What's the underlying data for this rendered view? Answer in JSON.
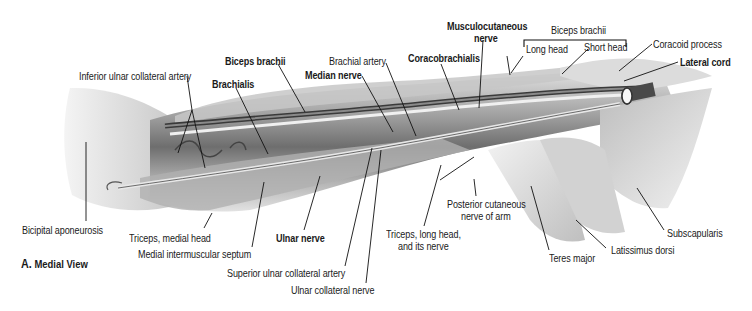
{
  "figure": {
    "caption_letter": "A.",
    "caption_text": "Medial View",
    "palette": {
      "background": "#ffffff",
      "muscle_light": "#d9d9d9",
      "muscle_mid": "#a6a6a6",
      "muscle_dark": "#5a5a5a",
      "vessel": "#3a3a3a",
      "leader_line": "#111111",
      "text": "#1a1a1a"
    },
    "bracket_label": "Biceps brachii",
    "labels": [
      {
        "id": "musculocutaneous-nerve-1",
        "text": "Musculocutaneous",
        "bold": true,
        "x": 447,
        "y": 20
      },
      {
        "id": "musculocutaneous-nerve-2",
        "text": "nerve",
        "bold": true,
        "x": 474,
        "y": 32
      },
      {
        "id": "biceps-brachii-top",
        "text": "Biceps brachii",
        "bold": false,
        "x": 551,
        "y": 24
      },
      {
        "id": "long-head",
        "text": "Long head",
        "bold": false,
        "x": 526,
        "y": 43
      },
      {
        "id": "short-head",
        "text": "Short head",
        "bold": false,
        "x": 584,
        "y": 41
      },
      {
        "id": "coracoid-process",
        "text": "Coracoid process",
        "bold": false,
        "x": 653,
        "y": 38
      },
      {
        "id": "lateral-cord",
        "text": "Lateral cord",
        "bold": true,
        "x": 680,
        "y": 56
      },
      {
        "id": "biceps-brachii",
        "text": "Biceps brachii",
        "bold": true,
        "x": 225,
        "y": 55
      },
      {
        "id": "brachial-artery",
        "text": "Brachial artery",
        "bold": false,
        "x": 329,
        "y": 55
      },
      {
        "id": "coracobrachialis",
        "text": "Coracobrachialis",
        "bold": true,
        "x": 408,
        "y": 52
      },
      {
        "id": "median-nerve",
        "text": "Median nerve",
        "bold": true,
        "x": 305,
        "y": 69
      },
      {
        "id": "inferior-ulnar-collateral-artery",
        "text": "Inferior ulnar collateral artery",
        "bold": false,
        "x": 79,
        "y": 70
      },
      {
        "id": "brachialis",
        "text": "Brachialis",
        "bold": true,
        "x": 212,
        "y": 78
      },
      {
        "id": "bicipital-aponeurosis",
        "text": "Bicipital aponeurosis",
        "bold": false,
        "x": 22,
        "y": 224
      },
      {
        "id": "triceps-medial-head",
        "text": "Triceps, medial head",
        "bold": false,
        "x": 129,
        "y": 232
      },
      {
        "id": "ulnar-nerve",
        "text": "Ulnar nerve",
        "bold": true,
        "x": 276,
        "y": 232
      },
      {
        "id": "medial-intermuscular-septum",
        "text": "Medial intermuscular septum",
        "bold": false,
        "x": 138,
        "y": 248
      },
      {
        "id": "superior-ulnar-collateral-artery",
        "text": "Superior ulnar collateral artery",
        "bold": false,
        "x": 227,
        "y": 267
      },
      {
        "id": "ulnar-collateral-nerve",
        "text": "Ulnar collateral nerve",
        "bold": false,
        "x": 291,
        "y": 284
      },
      {
        "id": "posterior-cutaneous-1",
        "text": "Posterior cutaneous",
        "bold": false,
        "x": 447,
        "y": 198
      },
      {
        "id": "posterior-cutaneous-2",
        "text": "nerve of arm",
        "bold": false,
        "x": 461,
        "y": 210
      },
      {
        "id": "triceps-long-head-1",
        "text": "Triceps, long head,",
        "bold": false,
        "x": 386,
        "y": 228
      },
      {
        "id": "triceps-long-head-2",
        "text": "and its nerve",
        "bold": false,
        "x": 398,
        "y": 240
      },
      {
        "id": "subscapularis",
        "text": "Subscapularis",
        "bold": false,
        "x": 667,
        "y": 227
      },
      {
        "id": "latissimus-dorsi",
        "text": "Latissimus dorsi",
        "bold": false,
        "x": 611,
        "y": 244
      },
      {
        "id": "teres-major",
        "text": "Teres major",
        "bold": false,
        "x": 549,
        "y": 252
      }
    ]
  }
}
